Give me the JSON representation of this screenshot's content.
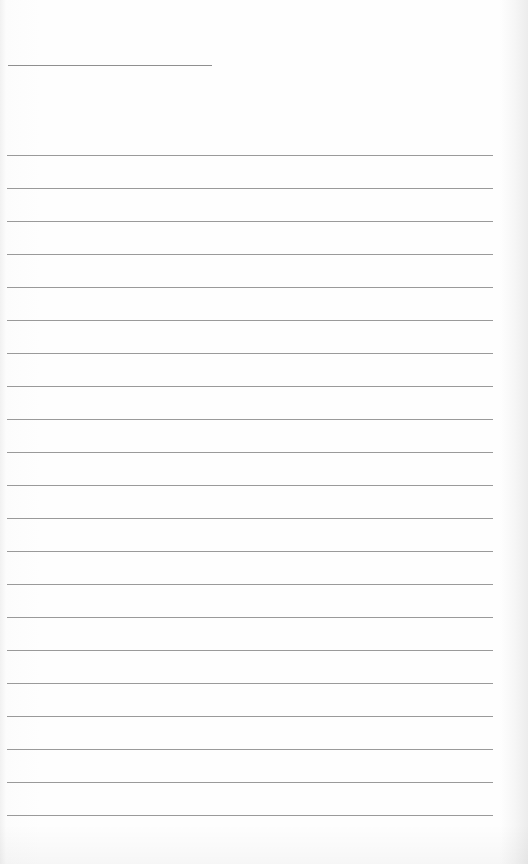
{
  "page": {
    "type": "lined-paper",
    "background_color": "#fdfdfd",
    "line_color": "#9a9a9a",
    "title_line": {
      "present": true
    },
    "ruled_lines": {
      "count": 21,
      "spacing_px": 33
    }
  }
}
